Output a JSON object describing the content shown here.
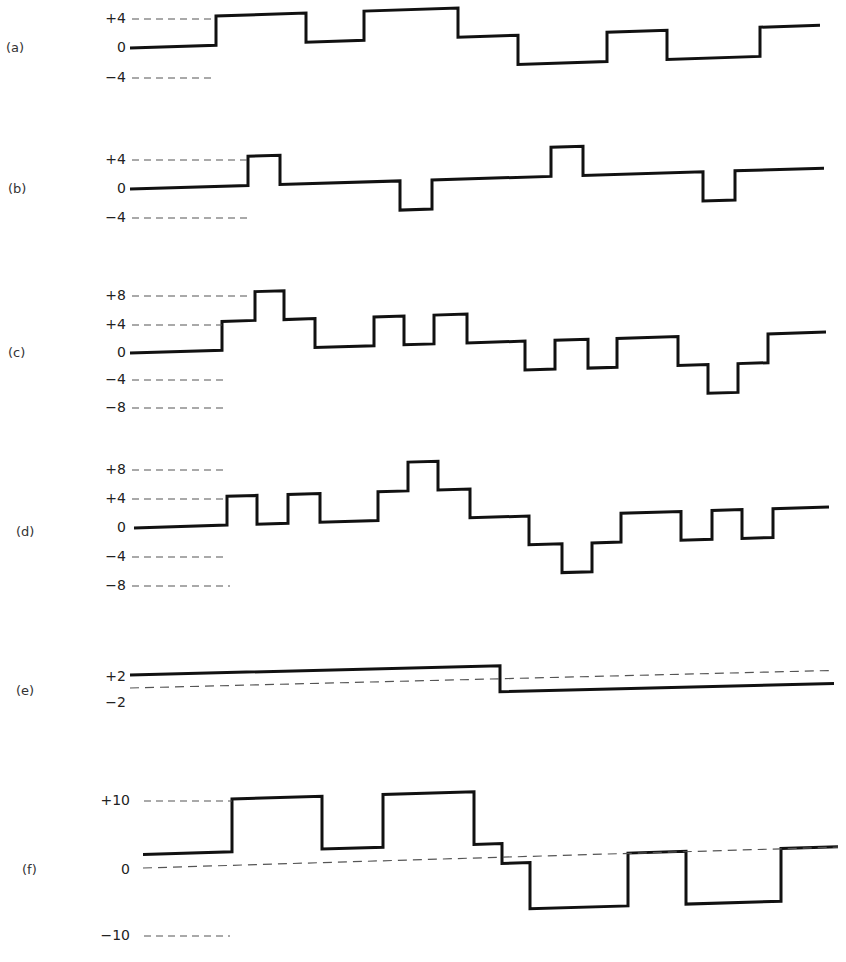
{
  "chart_data": [
    {
      "type": "line",
      "title": "(a)",
      "y_ticks": [
        "+4",
        "0",
        "-4"
      ],
      "step_edges": [
        130,
        216,
        306,
        364,
        458,
        518,
        607,
        667,
        760,
        820
      ],
      "values": [
        0,
        4,
        0,
        4,
        0,
        -4,
        0,
        -4,
        0
      ],
      "zero_y": 48,
      "unit_px": 7.3,
      "label_y": 48,
      "tick_y": {
        "+4": 19,
        "0": 48,
        "-4": 78
      },
      "dash_ends": {
        "+4": 216,
        "-4": 216
      },
      "tilt": -0.033
    },
    {
      "type": "line",
      "title": "(b)",
      "y_ticks": [
        "+4",
        "0",
        "-4"
      ],
      "step_edges": [
        130,
        248,
        280,
        400,
        432,
        551,
        583,
        703,
        735,
        824
      ],
      "values": [
        0,
        4,
        0,
        -4,
        0,
        4,
        0,
        -4,
        0
      ],
      "zero_y": 189,
      "unit_px": 7.3,
      "label_y": 189,
      "tick_y": {
        "+4": 160,
        "0": 189,
        "-4": 218
      },
      "dash_ends": {
        "+4": 248,
        "-4": 250
      },
      "tilt": -0.03
    },
    {
      "type": "line",
      "title": "(c)",
      "y_ticks": [
        "+8",
        "+4",
        "0",
        "-4",
        "-8"
      ],
      "step_edges": [
        130,
        222,
        255,
        284,
        315,
        374,
        404,
        434,
        467,
        525,
        555,
        588,
        617,
        678,
        708,
        738,
        768,
        826
      ],
      "values": [
        0,
        4,
        8,
        4,
        0,
        4,
        0,
        4,
        0,
        -4,
        0,
        -4,
        0,
        -4,
        -8,
        -4,
        0
      ],
      "zero_y": 353,
      "unit_px": 7.2,
      "label_y": 353,
      "tick_y": {
        "+8": 296,
        "+4": 325,
        "0": 353,
        "-4": 380,
        "-8": 408
      },
      "dash_ends": {
        "+8": 250,
        "+4": 222,
        "-4": 224,
        "-8": 224
      },
      "tilt": -0.03
    },
    {
      "type": "line",
      "title": "(d)",
      "y_ticks": [
        "+8",
        "+4",
        "0",
        "-4",
        "-8"
      ],
      "step_edges": [
        134,
        227,
        257,
        288,
        320,
        378,
        408,
        438,
        470,
        529,
        562,
        592,
        621,
        681,
        712,
        742,
        773,
        829
      ],
      "values": [
        0,
        4,
        0,
        4,
        0,
        4,
        8,
        4,
        0,
        -4,
        -8,
        -4,
        0,
        -4,
        0,
        -4,
        0
      ],
      "zero_y": 528,
      "unit_px": 7.2,
      "label_y": 528,
      "tick_y": {
        "+8": 470,
        "+4": 499,
        "0": 528,
        "-4": 557,
        "-8": 586
      },
      "dash_ends": {
        "+8": 225,
        "+4": 227,
        "-4": 228,
        "-8": 230
      },
      "tilt": -0.03
    },
    {
      "type": "line",
      "title": "(e)",
      "y_ticks": [
        "+2",
        "-2"
      ],
      "step_edges": [
        130,
        500,
        834
      ],
      "values": [
        2,
        -2
      ],
      "zero_y": 688,
      "unit_px": 6.5,
      "label_y": 691,
      "tick_y": {
        "+2": 677,
        "-2": 703
      },
      "midline": true,
      "tilt": -0.025
    },
    {
      "type": "line",
      "title": "(f)",
      "y_ticks": [
        "+10",
        "0",
        "-10"
      ],
      "step_edges": [
        143,
        232,
        322,
        383,
        474,
        502,
        530,
        628,
        686,
        781,
        838
      ],
      "values": [
        2,
        10,
        2,
        10,
        2,
        -1,
        -8,
        0,
        -8,
        0
      ],
      "zero_y": 868,
      "unit_px": 6.6,
      "label_y": 870,
      "tick_y": {
        "+10": 801,
        "0": 870,
        "-10": 936
      },
      "dash_ends": {
        "+10": 232,
        "-10": 230
      },
      "midline": true,
      "tilt": -0.03
    }
  ],
  "figure": {
    "panel_labels": [
      "(a)",
      "(b)",
      "(c)",
      "(d)",
      "(e)",
      "(f)"
    ],
    "caption_partial": "... of ... and amplitude"
  }
}
